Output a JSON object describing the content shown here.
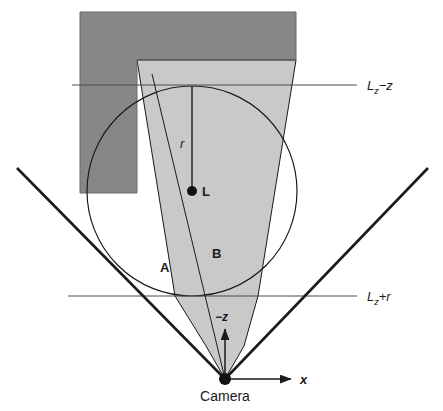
{
  "figure": {
    "background_color": "#ffffff",
    "colors": {
      "dark_block": "#878787",
      "light_cone": "#c9c9c9",
      "stroke": "#1a1a1a",
      "thin_line": "#4d4d4d",
      "text": "#1a1a1a"
    }
  },
  "labels": {
    "lz_minus_z": "L",
    "lz_minus_z_sub": "z",
    "lz_minus_z_op": "−z",
    "lz_plus_r": "L",
    "lz_plus_r_sub": "z",
    "lz_plus_r_op": "+r",
    "radius": "r",
    "light_point": "L",
    "region_a": "A",
    "region_b": "B",
    "axis_x": "x",
    "axis_minus_z": "−z",
    "camera": "Camera"
  },
  "geometry": {
    "camera_point": {
      "x": 225,
      "y": 379
    },
    "light_center": {
      "x": 192,
      "y": 191
    },
    "light_radius": 105,
    "frustum_left_end": {
      "x": 17,
      "y": 168
    },
    "frustum_right_end": {
      "x": 428,
      "y": 168
    },
    "line_lz_minus_z_y": 85,
    "line_lz_plus_r_y": 296,
    "dark_block": {
      "x": 80,
      "y": 12,
      "w": 216,
      "h": 48,
      "notch_w": 57,
      "notch_h": 133
    },
    "cone_top_y": 60,
    "cone_top_left_x": 137,
    "cone_top_right_x": 296
  }
}
